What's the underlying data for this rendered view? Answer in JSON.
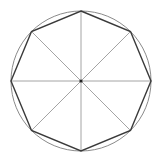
{
  "diagram": {
    "type": "inscribed-regular-polygon",
    "title": "",
    "shapes": {
      "circle": {
        "cx": 81,
        "cy": 81,
        "r": 70,
        "stroke": "#8a8a8a",
        "stroke_width": 1
      },
      "polygon": {
        "sides": 8,
        "cx": 81,
        "cy": 81,
        "r": 70,
        "start_angle_deg": -90,
        "stroke": "#3a3a3a",
        "stroke_width": 1.4
      },
      "spokes": {
        "count": 8,
        "stroke": "#9a9a9a",
        "stroke_width": 0.9
      },
      "center_point": {
        "cx": 81,
        "cy": 81,
        "r": 1.6,
        "fill": "#222222"
      }
    },
    "background": "#ffffff"
  }
}
